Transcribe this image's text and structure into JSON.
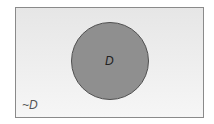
{
  "diagram": {
    "type": "venn",
    "universe": {
      "label": "~D",
      "fill": "#eeeeee",
      "border": "#8a8a8a"
    },
    "sets": [
      {
        "label": "D",
        "fill": "#8f8f8f",
        "border": "#505050"
      }
    ]
  }
}
